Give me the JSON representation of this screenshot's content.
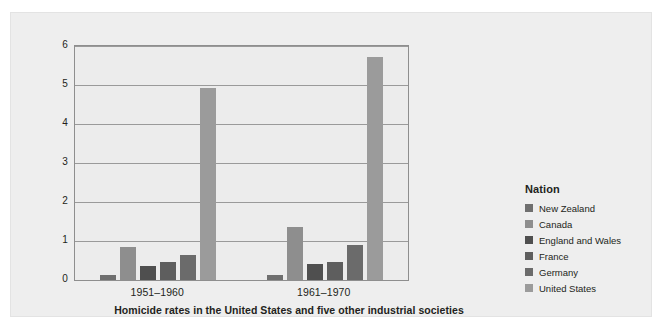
{
  "chart_data": {
    "type": "bar",
    "title": "",
    "caption": "Homicide rates in the United States and five other industrial societies",
    "xlabel": "",
    "ylabel": "Mean annual rate of murders per 100,000 people",
    "categories": [
      "1951–1960",
      "1961–1970"
    ],
    "ylim": [
      0,
      6
    ],
    "yticks": [
      0,
      1,
      2,
      3,
      4,
      5,
      6
    ],
    "ytick_labels": [
      "0",
      "1",
      "2",
      "3",
      "4",
      "5",
      "6"
    ],
    "grid": true,
    "legend_position": "right",
    "legend_title": "Nation",
    "series": [
      {
        "name": "New Zealand",
        "color": "#6f6f6f",
        "values": [
          0.14,
          0.14
        ]
      },
      {
        "name": "Canada",
        "color": "#8e8e8e",
        "values": [
          0.85,
          1.35
        ]
      },
      {
        "name": "England and Wales",
        "color": "#4f4f4f",
        "values": [
          0.37,
          0.4
        ]
      },
      {
        "name": "France",
        "color": "#5e5e5e",
        "values": [
          0.47,
          0.47
        ]
      },
      {
        "name": "Germany",
        "color": "#6b6b6b",
        "values": [
          0.65,
          0.9
        ]
      },
      {
        "name": "United States",
        "color": "#9b9b9b",
        "values": [
          4.93,
          5.73
        ]
      }
    ]
  },
  "legend": {
    "title": "Nation",
    "items": [
      {
        "label": "New Zealand",
        "color": "#6f6f6f"
      },
      {
        "label": "Canada",
        "color": "#8e8e8e"
      },
      {
        "label": "England and Wales",
        "color": "#4f4f4f"
      },
      {
        "label": "France",
        "color": "#5e5e5e"
      },
      {
        "label": "Germany",
        "color": "#6b6b6b"
      },
      {
        "label": "United States",
        "color": "#9b9b9b"
      }
    ]
  },
  "axes": {
    "y_title": "Mean annual rate of murders per 100,000 people",
    "y_tick_labels": [
      "6",
      "5",
      "4",
      "3",
      "2",
      "1",
      "0"
    ],
    "x_tick_labels": [
      "1951–1960",
      "1961–1970"
    ]
  },
  "caption": "Homicide rates in the United States and five other industrial societies",
  "colors": {
    "page_background": "#ffffff",
    "panel_background": "#eeeeee",
    "plot_background": "#ececec",
    "gridline": "#9a9a9a",
    "axis_border": "#8e8e8e",
    "text": "#231f20"
  }
}
